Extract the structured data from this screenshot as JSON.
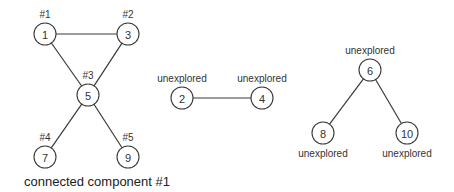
{
  "diagram": {
    "nodes": [
      {
        "id": "1",
        "x": 45,
        "y": 34,
        "label": "#1",
        "label_pos": "above"
      },
      {
        "id": "3",
        "x": 128,
        "y": 34,
        "label": "#2",
        "label_pos": "above"
      },
      {
        "id": "5",
        "x": 88,
        "y": 95,
        "label": "#3",
        "label_pos": "above"
      },
      {
        "id": "7",
        "x": 45,
        "y": 157,
        "label": "#4",
        "label_pos": "above"
      },
      {
        "id": "9",
        "x": 128,
        "y": 157,
        "label": "#5",
        "label_pos": "above"
      },
      {
        "id": "2",
        "x": 182,
        "y": 98,
        "label": "unexplored",
        "label_pos": "above"
      },
      {
        "id": "4",
        "x": 262,
        "y": 98,
        "label": "unexplored",
        "label_pos": "above"
      },
      {
        "id": "6",
        "x": 370,
        "y": 70,
        "label": "unexplored",
        "label_pos": "above"
      },
      {
        "id": "8",
        "x": 323,
        "y": 133,
        "label": "unexplored",
        "label_pos": "below"
      },
      {
        "id": "10",
        "x": 407,
        "y": 133,
        "label": "unexplored",
        "label_pos": "below"
      }
    ],
    "edges": [
      [
        "1",
        "3"
      ],
      [
        "1",
        "5"
      ],
      [
        "3",
        "5"
      ],
      [
        "5",
        "7"
      ],
      [
        "5",
        "9"
      ],
      [
        "2",
        "4"
      ],
      [
        "6",
        "8"
      ],
      [
        "6",
        "10"
      ]
    ],
    "caption": "connected component #1",
    "colors": {
      "stroke": "#3a3a3a",
      "text": "#333333",
      "background": "#ffffff"
    }
  }
}
